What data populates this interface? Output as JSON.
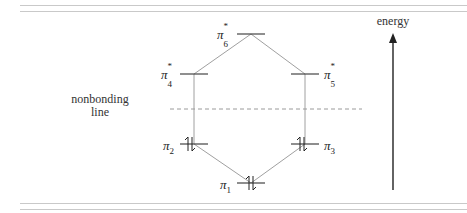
{
  "diagram": {
    "type": "molecular-orbital-energy-diagram",
    "axis_label": "energy",
    "nonbonding_label_line1": "nonbonding",
    "nonbonding_label_line2": "line",
    "orbitals": [
      {
        "id": "pi1",
        "symbol": "π",
        "index": "1",
        "star": "",
        "electrons": 2,
        "level": "bonding",
        "position": "bottom-center"
      },
      {
        "id": "pi2",
        "symbol": "π",
        "index": "2",
        "star": "",
        "electrons": 2,
        "level": "bonding",
        "position": "left"
      },
      {
        "id": "pi3",
        "symbol": "π",
        "index": "3",
        "star": "",
        "electrons": 2,
        "level": "bonding",
        "position": "right"
      },
      {
        "id": "pi4",
        "symbol": "π",
        "index": "4",
        "star": "*",
        "electrons": 0,
        "level": "antibonding",
        "position": "left"
      },
      {
        "id": "pi5",
        "symbol": "π",
        "index": "5",
        "star": "*",
        "electrons": 0,
        "level": "antibonding",
        "position": "right"
      },
      {
        "id": "pi6",
        "symbol": "π",
        "index": "6",
        "star": "*",
        "electrons": 0,
        "level": "antibonding",
        "position": "top-center"
      }
    ]
  },
  "colors": {
    "rule": "#c9c9c9",
    "connector": "#9a9a9a",
    "level": "#333333",
    "dashed": "#999999",
    "arrow": "#222222"
  }
}
